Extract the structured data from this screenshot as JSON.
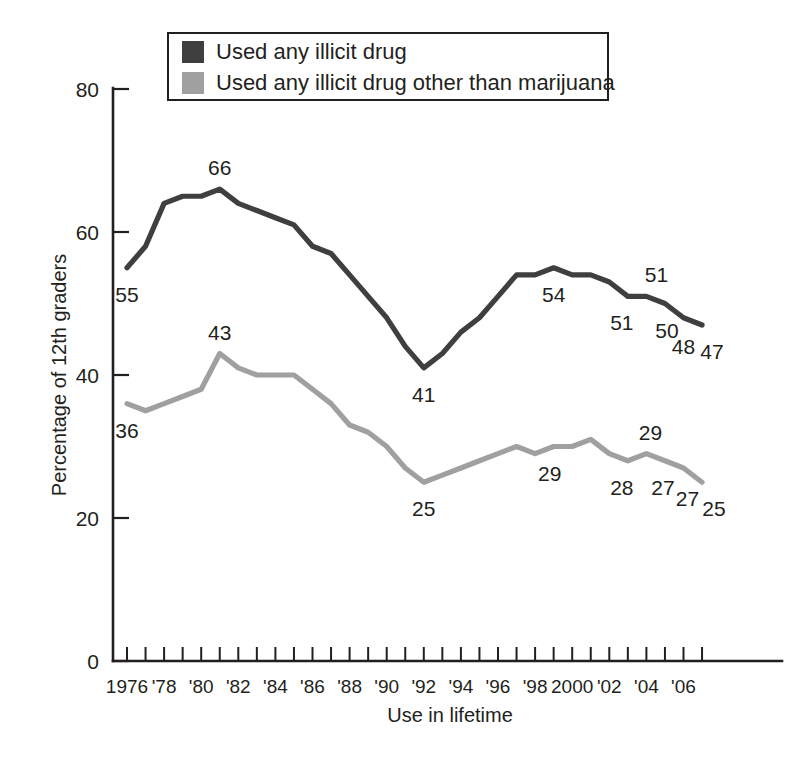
{
  "chart_data": {
    "type": "line",
    "title": "",
    "xlabel": "Use in lifetime",
    "ylabel": "Percentage of 12th graders",
    "ylim": [
      0,
      80
    ],
    "ytick_values": [
      0,
      20,
      40,
      60,
      80
    ],
    "ytick_labels": [
      "0",
      "20",
      "40",
      "60",
      "80"
    ],
    "xlim": [
      1976,
      2007
    ],
    "grid": false,
    "legend_position": "top-center",
    "x": [
      1976,
      1977,
      1978,
      1979,
      1980,
      1981,
      1982,
      1983,
      1984,
      1985,
      1986,
      1987,
      1988,
      1989,
      1990,
      1991,
      1992,
      1993,
      1994,
      1995,
      1996,
      1997,
      1998,
      1999,
      2000,
      2001,
      2002,
      2003,
      2004,
      2005,
      2006,
      2007
    ],
    "xtick_labels": [
      "1976",
      "'78",
      "'80",
      "'82",
      "'84",
      "'86",
      "'88",
      "'90",
      "'92",
      "'94",
      "'96",
      "'98",
      "2000",
      "'02",
      "'04",
      "'06"
    ],
    "xtick_label_years": [
      1976,
      1978,
      1980,
      1982,
      1984,
      1986,
      1988,
      1990,
      1992,
      1994,
      1996,
      1998,
      2000,
      2002,
      2004,
      2006
    ],
    "series": [
      {
        "name": "Used any illicit drug",
        "color": "#3f3f3f",
        "values": [
          55,
          58,
          64,
          65,
          65,
          66,
          64,
          63,
          62,
          61,
          58,
          57,
          54,
          51,
          48,
          44,
          41,
          43,
          46,
          48,
          51,
          54,
          54,
          55,
          54,
          54,
          53,
          51,
          51,
          50,
          48,
          47
        ]
      },
      {
        "name": "Used any illicit drug other than marijuana",
        "color": "#a0a0a0",
        "values": [
          36,
          35,
          36,
          37,
          38,
          43,
          41,
          40,
          40,
          40,
          38,
          36,
          33,
          32,
          30,
          27,
          25,
          26,
          27,
          28,
          29,
          30,
          29,
          30,
          30,
          31,
          29,
          28,
          29,
          28,
          27,
          25
        ]
      }
    ],
    "annotations": [
      {
        "text": "55",
        "year": 1976,
        "value": 55,
        "series": 0,
        "dx": 0,
        "dy": 34
      },
      {
        "text": "66",
        "year": 1981,
        "value": 66,
        "series": 0,
        "dx": 0,
        "dy": -14
      },
      {
        "text": "41",
        "year": 1992,
        "value": 41,
        "series": 0,
        "dx": 0,
        "dy": 34
      },
      {
        "text": "54",
        "year": 1999,
        "value": 55,
        "series": 0,
        "dx": 0,
        "dy": 34
      },
      {
        "text": "51",
        "year": 2003,
        "value": 51,
        "series": 0,
        "dx": -6,
        "dy": 34
      },
      {
        "text": "51",
        "year": 2004,
        "value": 51,
        "series": 0,
        "dx": 10,
        "dy": -14
      },
      {
        "text": "50",
        "year": 2005,
        "value": 50,
        "series": 0,
        "dx": 2,
        "dy": 34
      },
      {
        "text": "48",
        "year": 2006,
        "value": 48,
        "series": 0,
        "dx": 0,
        "dy": 36
      },
      {
        "text": "47",
        "year": 2007,
        "value": 47,
        "series": 0,
        "dx": 10,
        "dy": 34
      },
      {
        "text": "36",
        "year": 1976,
        "value": 36,
        "series": 1,
        "dx": 0,
        "dy": 34
      },
      {
        "text": "43",
        "year": 1981,
        "value": 43,
        "series": 1,
        "dx": 0,
        "dy": -14
      },
      {
        "text": "25",
        "year": 1992,
        "value": 25,
        "series": 1,
        "dx": 0,
        "dy": 34
      },
      {
        "text": "29",
        "year": 1999,
        "value": 30,
        "series": 1,
        "dx": -4,
        "dy": 34
      },
      {
        "text": "28",
        "year": 2003,
        "value": 28,
        "series": 1,
        "dx": -6,
        "dy": 34
      },
      {
        "text": "29",
        "year": 2004,
        "value": 29,
        "series": 1,
        "dx": 4,
        "dy": -14
      },
      {
        "text": "27",
        "year": 2005,
        "value": 28,
        "series": 1,
        "dx": -2,
        "dy": 34
      },
      {
        "text": "27",
        "year": 2006,
        "value": 27,
        "series": 1,
        "dx": 4,
        "dy": 38
      },
      {
        "text": "25",
        "year": 2007,
        "value": 25,
        "series": 1,
        "dx": 12,
        "dy": 34
      }
    ]
  },
  "legend": {
    "items": [
      {
        "label": "Used any illicit drug",
        "color": "#3f3f3f"
      },
      {
        "label": "Used any illicit drug other than marijuana",
        "color": "#a0a0a0"
      }
    ]
  },
  "colors": {
    "dark_series": "#3f3f3f",
    "light_series": "#a0a0a0",
    "axis": "#231f20",
    "background": "#ffffff"
  }
}
